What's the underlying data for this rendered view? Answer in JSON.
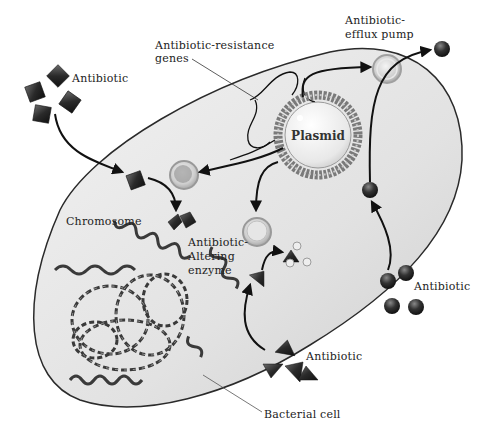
{
  "diagram": {
    "colors": {
      "cell_fill": "#e4e4e4",
      "cell_outline": "#2a2a2a",
      "molecule_dark": "#2b2b2b",
      "plasmid_ring": "#8a8a8a",
      "arrow": "#111111"
    },
    "labels": {
      "antibiotic_top_left": "Antibiotic",
      "resistance_genes_line1": "Antibiotic-resistance",
      "resistance_genes_line2": "genes",
      "efflux_line1": "Antibiotic-",
      "efflux_line2": "efflux pump",
      "plasmid": "Plasmid",
      "chromosome": "Chromosome",
      "enzyme_line1": "Antibiotic-",
      "enzyme_line2": "Altering",
      "enzyme_line3": "enzyme",
      "antibiotic_right": "Antibiotic",
      "antibiotic_bottom": "Antibiotic",
      "bacterial_cell": "Bacterial cell"
    },
    "nodes": [
      {
        "id": "antibiotic-diamonds",
        "shape": "diamond",
        "count": 4
      },
      {
        "id": "antibiotic-spheres",
        "shape": "sphere",
        "count": 4
      },
      {
        "id": "antibiotic-triangles",
        "shape": "triangle",
        "count": 4
      },
      {
        "id": "plasmid",
        "shape": "ring"
      },
      {
        "id": "efflux-pump",
        "shape": "ring"
      },
      {
        "id": "enzyme-protein",
        "shape": "ring"
      },
      {
        "id": "modifier-protein",
        "shape": "ring"
      },
      {
        "id": "chromosome",
        "shape": "coiled-dna"
      }
    ],
    "edges": [
      {
        "from": "antibiotic-diamonds",
        "to": "diamond-inside-cell"
      },
      {
        "from": "diamond-inside-cell",
        "to": "broken-diamond"
      },
      {
        "from": "plasmid",
        "to": "efflux-pump"
      },
      {
        "from": "plasmid",
        "to": "enzyme-protein"
      },
      {
        "from": "plasmid",
        "to": "modifier-protein"
      },
      {
        "from": "antibiotic-spheres",
        "to": "sphere-inside-cell"
      },
      {
        "from": "sphere-inside-cell",
        "to": "outside-sphere",
        "via": "efflux-pump"
      },
      {
        "from": "antibiotic-triangles",
        "to": "triangle-inside-cell"
      },
      {
        "from": "triangle-inside-cell",
        "to": "modified-triangle"
      }
    ]
  }
}
